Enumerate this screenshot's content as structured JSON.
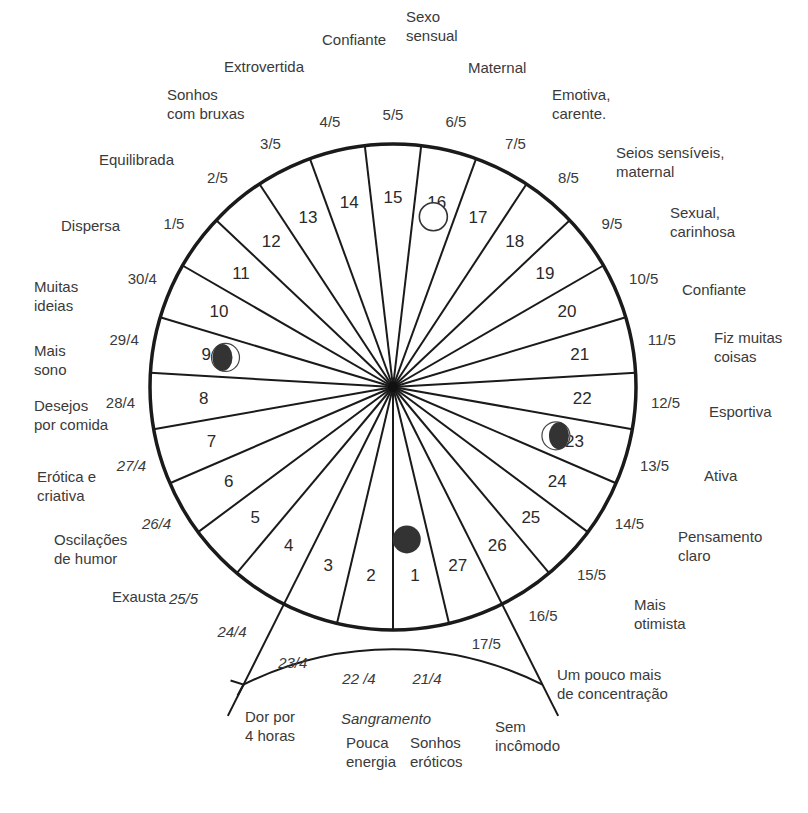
{
  "diagram": {
    "type": "menstrual-cycle-wheel",
    "center": [
      393,
      387
    ],
    "radius": 243,
    "segment_count": 27,
    "colors": {
      "line": "#1a1a1a",
      "text": "#3a3a3a",
      "moon_dark": "#333333"
    },
    "segments": [
      {
        "day": "1",
        "date": "21/4",
        "mood": "Dor por\n4 horas"
      },
      {
        "day": "2",
        "date": "22 /4",
        "mood": "Pouca\nenergia"
      },
      {
        "day": "3",
        "date": "23/4",
        "mood": "Sonhos\neróticos"
      },
      {
        "day": "4",
        "date": "24/4",
        "mood": "Sem\nincômodo"
      },
      {
        "day": "5",
        "date": "25/5",
        "mood": "Um pouco mais\nde concentração"
      },
      {
        "day": "6",
        "date": "26/4",
        "mood": "Mais\notimista"
      },
      {
        "day": "7",
        "date": "27/4",
        "mood": "Pensamento\nclaro"
      },
      {
        "day": "8",
        "date": "28/4",
        "mood": "Ativa"
      },
      {
        "day": "9",
        "date": "29/4",
        "mood": "Esportiva"
      },
      {
        "day": "10",
        "date": "30/4",
        "mood": "Fiz muitas\ncoisas"
      },
      {
        "day": "11",
        "date": "1/5",
        "mood": "Confiante"
      },
      {
        "day": "12",
        "date": "2/5",
        "mood": "Sexual,\ncarinhosa"
      },
      {
        "day": "13",
        "date": "3/5",
        "mood": "Seios sensíveis,\nmaternal"
      },
      {
        "day": "14",
        "date": "4/5",
        "mood": "Emotiva,\ncarente."
      },
      {
        "day": "15",
        "date": "5/5",
        "mood": "Maternal"
      },
      {
        "day": "16",
        "date": "6/5",
        "mood": "Sexo\nsensual"
      },
      {
        "day": "17",
        "date": "7/5",
        "mood": "Confiante"
      },
      {
        "day": "18",
        "date": "8/5",
        "mood": "Extrovertida"
      },
      {
        "day": "19",
        "date": "9/5",
        "mood": "Sonhos\ncom bruxas"
      },
      {
        "day": "20",
        "date": "10/5",
        "mood": "Equilibrada"
      },
      {
        "day": "21",
        "date": "11/5",
        "mood": "Dispersa"
      },
      {
        "day": "22",
        "date": "12/5",
        "mood": "Muitas\nideias"
      },
      {
        "day": "23",
        "date": "13/5",
        "mood": "Mais\nsono"
      },
      {
        "day": "24",
        "date": "14/5",
        "mood": "Desejos\npor comida"
      },
      {
        "day": "25",
        "date": "15/5",
        "mood": "Erótica e\ncriativa"
      },
      {
        "day": "26",
        "date": "16/5",
        "mood": "Oscilações\nde humor"
      },
      {
        "day": "27",
        "date": "17/5",
        "mood": "Exausta"
      }
    ],
    "moon_phases": [
      {
        "day": "1",
        "phase": "new-moon"
      },
      {
        "day": "9",
        "phase": "first-quarter"
      },
      {
        "day": "16",
        "phase": "full-moon"
      },
      {
        "day": "23",
        "phase": "last-quarter"
      }
    ],
    "bleeding": {
      "label": "Sangramento",
      "from_day": "1",
      "to_day": "4",
      "arrow": "right"
    }
  }
}
